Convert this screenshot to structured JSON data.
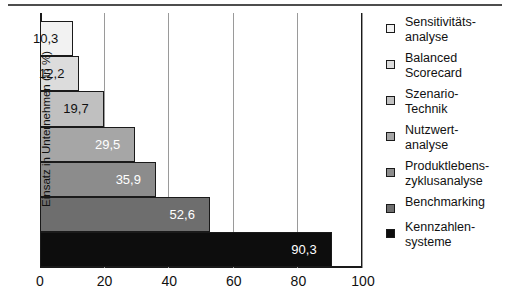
{
  "chart_data": {
    "type": "bar",
    "orientation": "horizontal",
    "title": "",
    "xlabel": "",
    "ylabel": "Einsatz in Unternehmen (in %)",
    "xlim": [
      0,
      100
    ],
    "xticks": [
      0,
      20,
      40,
      60,
      80,
      100
    ],
    "xtick_labels": [
      "0",
      "20",
      "40",
      "60",
      "80",
      "100"
    ],
    "grid": "vertical",
    "legend_position": "right",
    "categories": [
      "Sensitivitäts-\nanalyse",
      "Balanced\nScorecard",
      "Szenario-\nTechnik",
      "Nutzwert-\nanalyse",
      "Produktlebens-\nzyklusanalyse",
      "Benchmarking",
      "Kennzahlen-\nsysteme"
    ],
    "values": [
      10.3,
      12.2,
      19.7,
      29.5,
      35.9,
      52.6,
      90.3
    ],
    "value_labels": [
      "10,3",
      "12,2",
      "19,7",
      "29,5",
      "35,9",
      "52,6",
      "90,3"
    ],
    "colors": [
      "#f2f2f2",
      "#dcdcdc",
      "#c0c0c0",
      "#a6a6a6",
      "#8c8c8c",
      "#6e6e6e",
      "#0d0d0d"
    ],
    "label_colors": [
      "dark",
      "dark",
      "dark",
      "light",
      "light",
      "light",
      "light"
    ],
    "axis_color": "#1a1a1a",
    "gridline_color": "#9a9a9a"
  },
  "legend": {
    "items": [
      {
        "label": "Sensitivitäts-\nanalyse",
        "color": "#f2f2f2"
      },
      {
        "label": "Balanced\nScorecard",
        "color": "#dcdcdc"
      },
      {
        "label": "Szenario-\nTechnik",
        "color": "#c0c0c0"
      },
      {
        "label": "Nutzwert-\nanalyse",
        "color": "#a6a6a6"
      },
      {
        "label": "Produktlebens-\nzyklusanalyse",
        "color": "#8c8c8c"
      },
      {
        "label": "Benchmarking",
        "color": "#6e6e6e"
      },
      {
        "label": "Kennzahlen-\nsysteme",
        "color": "#0d0d0d"
      }
    ]
  }
}
